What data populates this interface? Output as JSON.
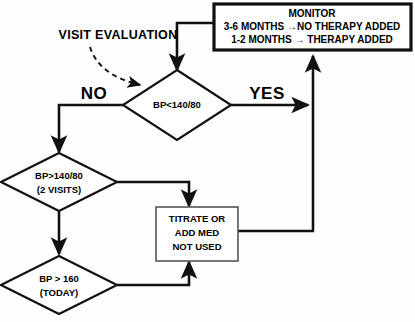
{
  "diagram": {
    "caption": {
      "label": "VISIT EVALUATION"
    },
    "branch_labels": {
      "no": "NO",
      "yes": "YES"
    },
    "monitor_box": {
      "name": "monitor-box",
      "line1": "MONITOR",
      "line2": "3-6 MONTHS →NO THERAPY ADDED",
      "line3": "1-2 MONTHS → THERAPY ADDED"
    },
    "decision_1": {
      "name": "decision-bp-lt-140-80",
      "line1": "BP<140/80"
    },
    "decision_2": {
      "name": "decision-bp-gt-140-80-2-visits",
      "line1": "BP>140/80",
      "line2": "(2 VISITS)"
    },
    "decision_3": {
      "name": "decision-bp-gt-160-today",
      "line1": "BP > 160",
      "line2": "(TODAY)"
    },
    "action_box": {
      "name": "titrate-or-add-med-box",
      "line1": "TITRATE OR",
      "line2": "ADD MED",
      "line3": "NOT USED"
    },
    "colors": {
      "stroke": "#111111",
      "thin_stroke": "#555555",
      "fill": "#ffffff",
      "background": "#fefefe",
      "text": "#000000"
    }
  }
}
